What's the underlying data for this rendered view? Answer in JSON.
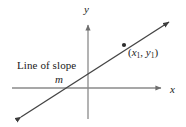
{
  "figure": {
    "background_color": "#ffffff",
    "width": 186,
    "height": 127,
    "axis_color": "#8a8a8a",
    "line_color": "#454545",
    "text_color": "#1a1a1a",
    "axes": {
      "x_axis_label": "x",
      "y_axis_label": "y",
      "x_axis_name": "x-axis",
      "y_axis_name": "y-axis",
      "origin": {
        "x": 88,
        "y": 88
      },
      "x_axis_start": {
        "x": 12,
        "y": 88
      },
      "x_axis_end": {
        "x": 165,
        "y": 88
      },
      "y_axis_start": {
        "x": 88,
        "y": 119
      },
      "y_axis_end": {
        "x": 88,
        "y": 21
      },
      "arrowheads": [
        "x-axis-right",
        "y-axis-top"
      ]
    },
    "slope_line": {
      "name": "line-of-slope-m",
      "start": {
        "x": 17,
        "y": 120
      },
      "end": {
        "x": 173,
        "y": 19
      },
      "arrowheads": [
        "start",
        "end"
      ],
      "caption_line_1": "Line of slope",
      "caption_line_2": "m"
    },
    "marked_point": {
      "name": "point-x1-y1",
      "position": {
        "x": 124,
        "y": 45
      },
      "label_open_paren": "(",
      "label_x": "x",
      "label_x_subscript": "1",
      "label_comma": ", ",
      "label_y": "y",
      "label_y_subscript": "1",
      "label_close_paren": ")",
      "label_plain": "(x1, y1)"
    }
  }
}
